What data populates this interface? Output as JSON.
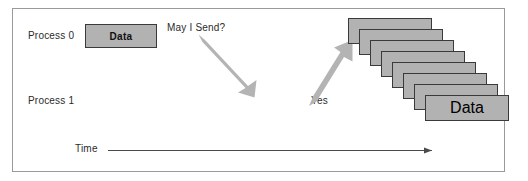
{
  "diagram": {
    "frame": {
      "border_color": "#9a9a9a"
    },
    "labels": {
      "process0": "Process 0",
      "process1": "Process 1",
      "may_i_send": "May I Send?",
      "yes": "Yes",
      "time": "Time"
    },
    "sender_box": {
      "text": "Data",
      "fill": "#b2b2b2",
      "stroke": "#3a3a3a"
    },
    "packet_stack": {
      "count": 8,
      "front_label": "Data",
      "fill": "#b2b2b2",
      "stroke": "#3a3a3a",
      "step_x": 11,
      "step_y": 11,
      "boxes": [
        {
          "label": ""
        },
        {
          "label": ""
        },
        {
          "label": ""
        },
        {
          "label": ""
        },
        {
          "label": ""
        },
        {
          "label": ""
        },
        {
          "label": ""
        },
        {
          "label": "Data"
        }
      ]
    },
    "arrows": [
      {
        "name": "may-i-send-arrow",
        "direction": "down-right",
        "color": "#b3b3b3",
        "from": [
          201,
          38
        ],
        "to": [
          252,
          92
        ]
      },
      {
        "name": "yes-arrow",
        "direction": "up-right",
        "color": "#b3b3b3",
        "from": [
          312,
          104
        ],
        "to": [
          352,
          43
        ]
      },
      {
        "name": "time-axis-arrow",
        "direction": "right",
        "color": "#4a4a4a",
        "from": [
          108,
          150
        ],
        "to": [
          437,
          150
        ]
      }
    ]
  }
}
